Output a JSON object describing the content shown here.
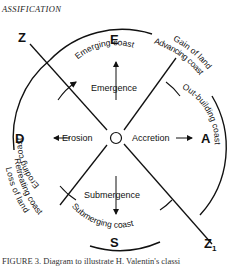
{
  "header": {
    "text": "ASSIFICATION"
  },
  "diagram": {
    "axis_labels": {
      "top": "E",
      "right": "A",
      "bottom": "S",
      "left": "D",
      "upper_left": "Z",
      "lower_right": "Z",
      "lower_right_sub": "1"
    },
    "processes": {
      "up": "Emergence",
      "right": "Accretion",
      "down": "Submergence",
      "left": "Erosion"
    },
    "inner_coasts": {
      "top": "Emerging coast",
      "right": "Out-building coast",
      "bottom": "Submerging coast",
      "left": "Eroding coast"
    },
    "outer_labels": {
      "upper_right_line1": "Gain of land",
      "upper_right_line2": "Advancing coast",
      "lower_left_line1": "Retreating coast",
      "lower_left_line2": "Loss of land"
    }
  },
  "caption": {
    "text": "FIGURE 3. Diagram to illustrate H. Valentin's classi"
  }
}
